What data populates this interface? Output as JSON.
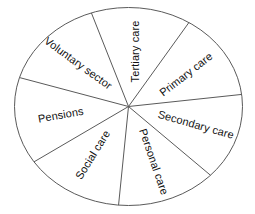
{
  "diagram": {
    "type": "pie-wheel",
    "title": "",
    "shape": "ellipse",
    "stroke_color": "#5a5a5a",
    "fill_color": "#ffffff",
    "text_color": "#111111",
    "center": {
      "x": 128.5,
      "y": 106.5
    },
    "radius_x": 114,
    "radius_y": 99,
    "sector_count": 7,
    "sectors": [
      {
        "label": "Tertiary care",
        "index": 0,
        "start_angle": -109,
        "end_angle": -58,
        "label_angle": -83,
        "label_radius_fraction": 0.56,
        "text_rotation": -90
      },
      {
        "label": "Primary care",
        "index": 1,
        "start_angle": -58,
        "end_angle": -7,
        "label_angle": -32,
        "label_radius_fraction": 0.6,
        "text_rotation": -38
      },
      {
        "label": "Secondary care",
        "index": 2,
        "start_angle": -7,
        "end_angle": 44,
        "label_angle": 18,
        "label_radius_fraction": 0.62,
        "text_rotation": 16
      },
      {
        "label": "Personal care",
        "index": 3,
        "start_angle": 44,
        "end_angle": 95,
        "label_angle": 69,
        "label_radius_fraction": 0.6,
        "text_rotation": 71
      },
      {
        "label": "Social care",
        "index": 4,
        "start_angle": 95,
        "end_angle": 146,
        "label_angle": 122,
        "label_radius_fraction": 0.58,
        "text_rotation": -58
      },
      {
        "label": "Pensions",
        "index": 5,
        "start_angle": 146,
        "end_angle": 197,
        "label_angle": 171,
        "label_radius_fraction": 0.6,
        "text_rotation": -10
      },
      {
        "label": "Voluntary sector",
        "index": 6,
        "start_angle": 197,
        "end_angle": 251,
        "label_angle": 224,
        "label_radius_fraction": 0.62,
        "text_rotation": 36
      }
    ],
    "spoke_angles": [
      -109,
      -58,
      -7,
      44,
      95,
      146,
      197
    ]
  },
  "chart_data": {
    "type": "pie",
    "title": "",
    "categories": [
      "Tertiary care",
      "Primary care",
      "Secondary care",
      "Personal care",
      "Social care",
      "Pensions",
      "Voluntary sector"
    ],
    "values": [
      51,
      51,
      51,
      51,
      51,
      51,
      54
    ],
    "value_unit": "degrees",
    "legend": "none",
    "grid": false,
    "xlabel": "",
    "ylabel": ""
  }
}
